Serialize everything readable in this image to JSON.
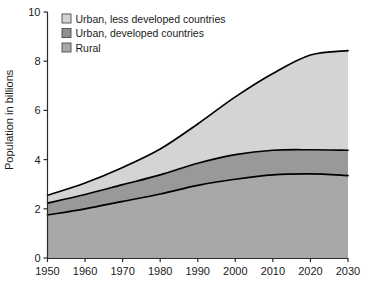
{
  "chart_data": {
    "type": "area",
    "stacked": true,
    "title": "",
    "xlabel": "",
    "ylabel": "Population in billions",
    "xlim": [
      1950,
      2030
    ],
    "ylim": [
      0,
      10
    ],
    "xticks": [
      1950,
      1960,
      1970,
      1980,
      1990,
      2000,
      2010,
      2020,
      2030
    ],
    "xtick_labels": [
      "1950",
      "1960",
      "1970",
      "1980",
      "1990",
      "2000",
      "2010",
      "2020",
      "2030"
    ],
    "yticks": [
      0,
      2,
      4,
      6,
      8,
      10
    ],
    "ytick_labels": [
      "0",
      "2",
      "4",
      "6",
      "8",
      "10"
    ],
    "grid": false,
    "legend_position": "top-left-inside",
    "x": [
      1950,
      1960,
      1970,
      1980,
      1990,
      2000,
      2010,
      2020,
      2030
    ],
    "series": [
      {
        "name": "Rural",
        "color": "#a8a8a8",
        "values": [
          1.75,
          2.0,
          2.3,
          2.6,
          2.95,
          3.2,
          3.38,
          3.42,
          3.35
        ]
      },
      {
        "name": "Urban, developed countries",
        "color": "#999999",
        "values": [
          0.48,
          0.58,
          0.68,
          0.78,
          0.9,
          1.0,
          1.0,
          0.98,
          1.03
        ]
      },
      {
        "name": "Urban, less developed countries",
        "color": "#d4d4d4",
        "values": [
          0.32,
          0.47,
          0.7,
          1.05,
          1.6,
          2.35,
          3.12,
          3.85,
          4.05
        ]
      }
    ],
    "cumulative_totals": {
      "rural": [
        1.75,
        2.0,
        2.3,
        2.6,
        2.95,
        3.2,
        3.38,
        3.42,
        3.35
      ],
      "rural_plus_urban_developed": [
        2.23,
        2.58,
        2.98,
        3.38,
        3.85,
        4.2,
        4.38,
        4.4,
        4.38
      ],
      "grand_total": [
        2.55,
        3.05,
        3.68,
        4.43,
        5.45,
        6.55,
        7.5,
        8.25,
        8.43
      ]
    },
    "legend": [
      {
        "label": "Urban, less developed countries",
        "swatch_color": "#d4d4d4"
      },
      {
        "label": "Urban, developed countries",
        "swatch_color": "#8f8f8f"
      },
      {
        "label": "Rural",
        "swatch_color": "#a8a8a8"
      }
    ],
    "colors": {
      "urban_less_developed": "#d4d4d4",
      "urban_developed": "#999999",
      "rural": "#a8a8a8",
      "line": "#000000",
      "axis": "#2b2b2b",
      "background": "#ffffff"
    }
  }
}
